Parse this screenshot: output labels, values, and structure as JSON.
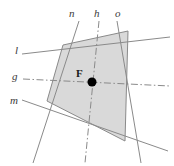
{
  "figure": {
    "background_color": "#ffffff",
    "polygon": {
      "name": "shaded-quadrilateral",
      "fill_color": "#d9d9d9",
      "stroke_color": "#8a8a8a",
      "vertices": [
        {
          "x": 63,
          "y": 45
        },
        {
          "x": 128,
          "y": 31
        },
        {
          "x": 125,
          "y": 141
        },
        {
          "x": 47,
          "y": 101
        }
      ]
    },
    "point": {
      "name": "center-point",
      "label": "F",
      "x": 92,
      "y": 82,
      "radius": 4.5,
      "color": "#000000",
      "label_x": 76,
      "label_y": 68
    },
    "lines": [
      {
        "id": "l",
        "label": "l",
        "style": "solid",
        "color": "#8a8a8a",
        "x1": 22,
        "y1": 54,
        "x2": 170,
        "y2": 37,
        "label_x": 15,
        "label_y": 45
      },
      {
        "id": "g",
        "label": "g",
        "style": "dash-dot",
        "color": "#8a8a8a",
        "x1": 23,
        "y1": 79,
        "x2": 170,
        "y2": 86,
        "label_x": 12,
        "label_y": 71
      },
      {
        "id": "m",
        "label": "m",
        "style": "solid",
        "color": "#8a8a8a",
        "x1": 22,
        "y1": 100,
        "x2": 168,
        "y2": 151,
        "label_x": 10,
        "label_y": 95
      },
      {
        "id": "n",
        "label": "n",
        "style": "solid",
        "color": "#8a8a8a",
        "x1": 79,
        "y1": 21,
        "x2": 33,
        "y2": 163,
        "label_x": 69,
        "label_y": 8
      },
      {
        "id": "h",
        "label": "h",
        "style": "dash-dot",
        "color": "#8a8a8a",
        "x1": 99,
        "y1": 21,
        "x2": 85,
        "y2": 163,
        "label_x": 94,
        "label_y": 8
      },
      {
        "id": "o",
        "label": "o",
        "style": "solid",
        "color": "#8a8a8a",
        "x1": 117,
        "y1": 21,
        "x2": 141,
        "y2": 163,
        "label_x": 115,
        "label_y": 8
      }
    ]
  }
}
